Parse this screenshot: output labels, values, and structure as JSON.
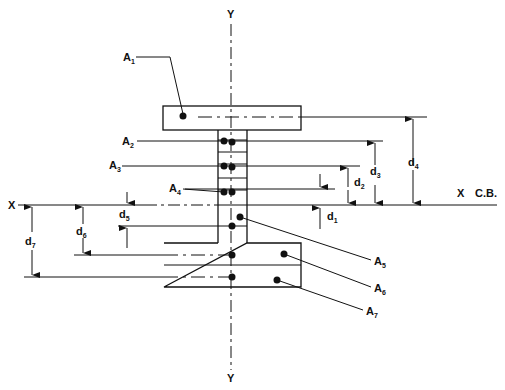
{
  "diagram": {
    "axes": {
      "y_top_label": "Y",
      "y_bottom_label": "Y",
      "x_left_label": "X",
      "x_right_label": "X",
      "centroid_label": "C.B."
    },
    "areas": [
      {
        "label": "A",
        "sub": "1"
      },
      {
        "label": "A",
        "sub": "2"
      },
      {
        "label": "A",
        "sub": "3"
      },
      {
        "label": "A",
        "sub": "4"
      },
      {
        "label": "A",
        "sub": "5"
      },
      {
        "label": "A",
        "sub": "6"
      },
      {
        "label": "A",
        "sub": "7"
      }
    ],
    "distances": [
      {
        "label": "d",
        "sub": "1"
      },
      {
        "label": "d",
        "sub": "2"
      },
      {
        "label": "d",
        "sub": "3"
      },
      {
        "label": "d",
        "sub": "4"
      },
      {
        "label": "d",
        "sub": "5"
      },
      {
        "label": "d",
        "sub": "6"
      },
      {
        "label": "d",
        "sub": "7"
      }
    ],
    "caption": ""
  }
}
